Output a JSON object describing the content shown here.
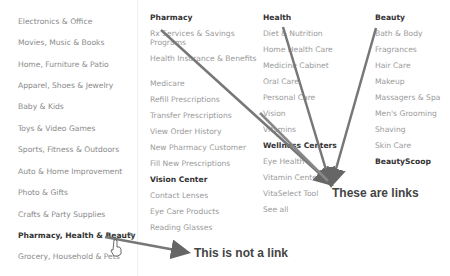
{
  "sidebar": {
    "items": [
      {
        "label": "Electronics & Office"
      },
      {
        "label": "Movies, Music & Books"
      },
      {
        "label": "Home, Furniture & Patio"
      },
      {
        "label": "Apparel, Shoes & Jewelry"
      },
      {
        "label": "Baby & Kids"
      },
      {
        "label": "Toys & Video Games"
      },
      {
        "label": "Sports, Fitness & Outdoors"
      },
      {
        "label": "Auto & Home Improvement"
      },
      {
        "label": "Photo & Gifts"
      },
      {
        "label": "Crafts & Party Supplies"
      },
      {
        "label": "Pharmacy, Health & Beauty",
        "active": true
      },
      {
        "label": "Grocery, Household & Pets"
      }
    ],
    "chevron": ">"
  },
  "columns": {
    "pharmacy": {
      "heading": "Pharmacy",
      "links": [
        "Rx Services & Savings Programs",
        "Health Insurance & Benefits",
        "Medicare",
        "Refill Prescriptions",
        "Transfer Prescriptions",
        "View Order History",
        "New Pharmacy Customer",
        "Fill New Prescriptions"
      ],
      "subheading": "Vision Center",
      "sublinks": [
        "Contact Lenses",
        "Eye Care Products",
        "Reading Glasses"
      ]
    },
    "health": {
      "heading": "Health",
      "links": [
        "Diet & Nutrition",
        "Home Health Care",
        "Medicine Cabinet",
        "Oral Care",
        "Personal Care",
        "Vision",
        "Vitamins"
      ],
      "subheading": "Wellness Centers",
      "sublinks": [
        "Eye Health",
        "Vitamin Center",
        "VitaSelect Tool",
        "See all"
      ]
    },
    "beauty": {
      "heading": "Beauty",
      "links": [
        "Bath & Body",
        "Fragrances",
        "Hair Care",
        "Makeup",
        "Massagers & Spa",
        "Men's Grooming",
        "Shaving",
        "Skin Care"
      ],
      "subheading": "BeautyScoop"
    }
  },
  "annotations": {
    "links_label": "These are links",
    "not_link_label": "This is not a link",
    "arrow_color": "#666666"
  }
}
